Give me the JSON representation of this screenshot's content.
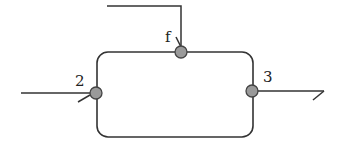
{
  "diagram": {
    "colors": {
      "line": "#333333",
      "node_fill": "#9a9a9a",
      "node_stroke": "#444444",
      "label": "#222222"
    },
    "box": {
      "x": 97,
      "y": 52,
      "width": 156,
      "height": 85,
      "radius": 11
    },
    "nodes": [
      {
        "id": "f",
        "label": "f",
        "cx": 181,
        "cy": 52
      },
      {
        "id": "2",
        "label": "2",
        "cx": 96,
        "cy": 93
      },
      {
        "id": "3",
        "label": "3",
        "cx": 252,
        "cy": 91
      }
    ],
    "streams": [
      {
        "name": "feed-f",
        "direction": "in"
      },
      {
        "name": "inlet-2",
        "direction": "in"
      },
      {
        "name": "outlet-3",
        "direction": "out"
      }
    ]
  }
}
